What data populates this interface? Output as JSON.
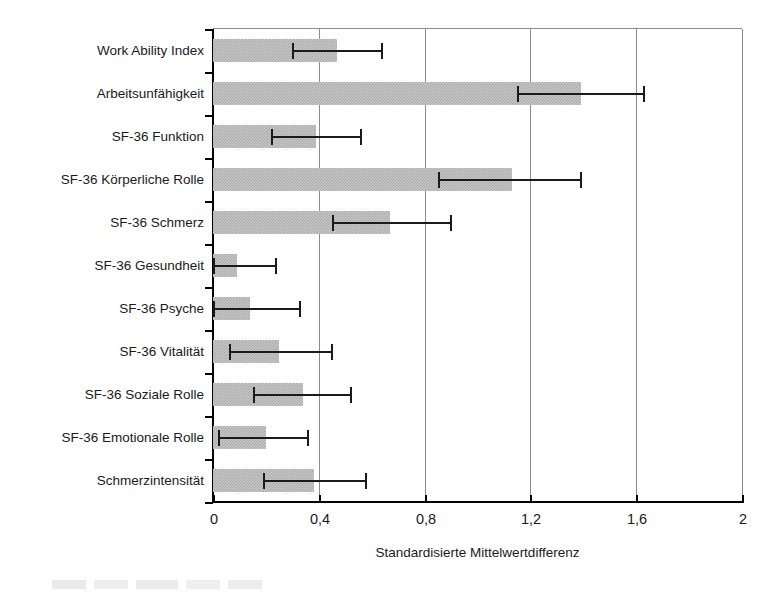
{
  "chart_data": {
    "type": "bar",
    "orientation": "horizontal",
    "title": "",
    "xlabel": "Standardisierte Mittelwertdifferenz",
    "ylabel": "",
    "xlim": [
      0,
      2
    ],
    "xticks": [
      "0",
      "0,4",
      "0,8",
      "1,2",
      "1,6",
      "2"
    ],
    "xtick_values": [
      0,
      0.4,
      0.8,
      1.2,
      1.6,
      2
    ],
    "grid": "vertical",
    "legend": "none",
    "bar_color": "#c6c6c6",
    "error_color": "#1a1a1a",
    "categories": [
      "Work Ability Index",
      "Arbeitsunfähigkeit",
      "SF-36 Funktion",
      "SF-36 Körperliche Rolle",
      "SF-36 Schmerz",
      "SF-36 Gesundheit",
      "SF-36 Psyche",
      "SF-36 Vitalität",
      "SF-36 Soziale Rolle",
      "SF-36 Emotionale Rolle",
      "Schmerzintensität"
    ],
    "values": [
      0.47,
      1.39,
      0.39,
      1.13,
      0.67,
      0.09,
      0.14,
      0.25,
      0.34,
      0.2,
      0.38
    ],
    "error_low": [
      0.3,
      1.15,
      0.22,
      0.85,
      0.45,
      0.0,
      0.0,
      0.06,
      0.15,
      0.02,
      0.19
    ],
    "error_high": [
      0.64,
      1.63,
      0.56,
      1.39,
      0.9,
      0.24,
      0.33,
      0.45,
      0.52,
      0.36,
      0.58
    ]
  }
}
